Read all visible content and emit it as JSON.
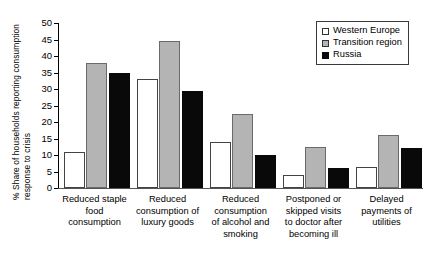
{
  "chart_data": {
    "type": "bar",
    "title": "",
    "subtitle": "",
    "xlabel": "",
    "ylabel": "% Share of households reporting consumption response to crisis",
    "ylabel_lines": [
      "% Share of households reporting consumption",
      "response to crisis"
    ],
    "ylim": [
      0,
      50
    ],
    "yticks": [
      0,
      5,
      10,
      15,
      20,
      25,
      30,
      35,
      40,
      45,
      50
    ],
    "ytick_labels": [
      "0",
      "5",
      "10",
      "15",
      "20",
      "25",
      "30",
      "35",
      "40",
      "45",
      "50"
    ],
    "grid": false,
    "legend_position": "top-right",
    "categories": [
      "Reduced staple\nfood\nconsumption",
      "Reduced\nconsumption of\nluxury goods",
      "Reduced\nconsumption\nof alcohol and\nsmoking",
      "Postponed or\nskipped visits\nto doctor after\nbecoming ill",
      "Delayed\npayments of\nutilities"
    ],
    "series": [
      {
        "name": "Western Europe",
        "color": "#ffffff",
        "values": [
          11,
          33,
          14,
          4,
          6.5
        ]
      },
      {
        "name": "Transition region",
        "color": "#b4b4b4",
        "values": [
          38,
          44.5,
          22.5,
          12.5,
          16
        ]
      },
      {
        "name": "Russia",
        "color": "#0a0a0a",
        "values": [
          35,
          29.5,
          10,
          6,
          12
        ]
      }
    ]
  },
  "legend": {
    "items": [
      {
        "label": "Western Europe",
        "swatch": "white"
      },
      {
        "label": "Transition region",
        "swatch": "gray"
      },
      {
        "label": "Russia",
        "swatch": "black"
      }
    ]
  }
}
